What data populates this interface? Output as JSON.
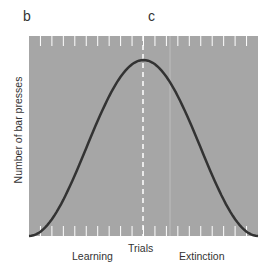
{
  "labels": {
    "panel_b": "b",
    "panel_c": "c"
  },
  "chart_data": {
    "type": "line",
    "title": "",
    "xlabel": "Trials",
    "ylabel": "Number of bar presses",
    "phases": [
      "Learning",
      "Extinction"
    ],
    "grid": false,
    "background": "#a6a6a6",
    "curve_color": "#333333",
    "x": [
      0,
      0.1,
      0.2,
      0.3,
      0.4,
      0.5,
      0.6,
      0.7,
      0.8,
      0.9,
      1.0
    ],
    "values": [
      0,
      0.1,
      0.32,
      0.62,
      0.9,
      1.0,
      0.9,
      0.62,
      0.32,
      0.1,
      0
    ],
    "divider_dashed_at": 0.5,
    "tick_count": 20,
    "ylim": [
      0,
      1
    ]
  }
}
